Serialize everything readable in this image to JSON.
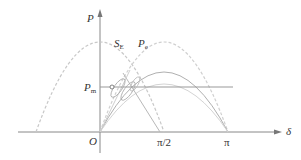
{
  "diagram": {
    "type": "power-angle curve",
    "axes": {
      "y_label": "P",
      "x_label": "δ",
      "origin_label": "O",
      "x_ticks": [
        "π/2",
        "π"
      ]
    },
    "labels": {
      "s_curve": "S",
      "s_curve_sub": "E",
      "pe_curve": "P",
      "pe_curve_sub": "e",
      "pm_line": "P",
      "pm_line_sub": "m"
    },
    "colors": {
      "axis": "#777777",
      "curve_dashed": "#c8c8c8",
      "curve_solid": "#b0b0b0",
      "curve_light": "#d0d0d0",
      "pm_line": "#999999",
      "text": "#333333"
    }
  }
}
